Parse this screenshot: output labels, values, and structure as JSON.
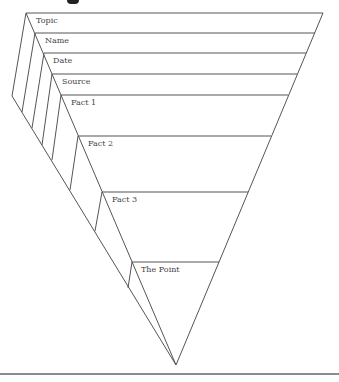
{
  "diagram": {
    "type": "inverted-pyramid",
    "line_color": "#555555",
    "text_color": "#444444",
    "levels": [
      {
        "label": "Topic"
      },
      {
        "label": "Name"
      },
      {
        "label": "Date"
      },
      {
        "label": "Source"
      },
      {
        "label": "Fact 1"
      },
      {
        "label": "Fact 2"
      },
      {
        "label": "Fact 3"
      },
      {
        "label": "The Point"
      }
    ]
  }
}
